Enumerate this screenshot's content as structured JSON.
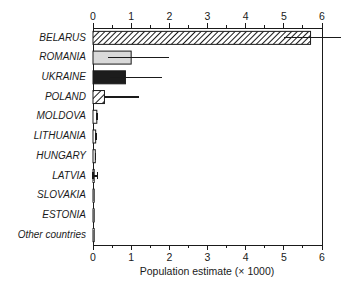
{
  "chart_data": {
    "type": "bar",
    "orientation": "horizontal",
    "title": "",
    "xlabel": "Population estimate (× 1000)",
    "ylabel": "",
    "xlim": [
      0,
      6
    ],
    "x_major_ticks": [
      0,
      1,
      2,
      3,
      4,
      5,
      6
    ],
    "x_minor_step": 0.5,
    "x_tick_labels": [
      "0",
      "1",
      "2",
      "3",
      "4",
      "5",
      "6"
    ],
    "axes_positions": [
      "top",
      "bottom"
    ],
    "grid": false,
    "legend": null,
    "categories": [
      "BELARUS",
      "ROMANIA",
      "UKRAINE",
      "POLAND",
      "MOLDOVA",
      "LITHUANIA",
      "HUNGARY",
      "LATVIA",
      "SLOVAKIA",
      "ESTONIA",
      "Other countries"
    ],
    "values": [
      5.7,
      1.0,
      0.85,
      0.3,
      0.1,
      0.07,
      0.06,
      0.03,
      0.005,
      0.005,
      0.005
    ],
    "error_low": [
      5.0,
      0.4,
      0.45,
      0.28,
      0.1,
      0.07,
      0.06,
      0.0,
      0.0,
      0.0,
      0.0
    ],
    "error_high": [
      6.5,
      2.0,
      1.8,
      1.2,
      0.12,
      0.08,
      0.07,
      0.12,
      0.0,
      0.0,
      0.0
    ],
    "bar_styles": [
      "hatch-fine-diagonal",
      "light-gray",
      "solid-black",
      "hatch-coarse-diagonal",
      "white",
      "white",
      "white",
      "white",
      "white",
      "white",
      "white"
    ],
    "colors": {
      "axis": "#1a1a1a",
      "bar_outline": "#1a1a1a",
      "light_gray_fill": "#d9d9d9",
      "solid_black_fill": "#1c1c1c",
      "white_fill": "#ffffff",
      "hatch_stroke": "#1a1a1a",
      "background": "#ffffff"
    }
  }
}
